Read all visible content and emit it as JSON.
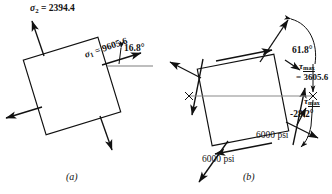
{
  "figure": {
    "units": "psi",
    "ink_color": "#111111",
    "axis_color": "#8a8a8a",
    "background": "#ffffff"
  },
  "panels": [
    {
      "id": "a",
      "caption": "(a)",
      "description": "principal-stress element",
      "element_rotation_deg": -17,
      "labels": {
        "sigma2_symbol": "σ",
        "sigma2_sub": "2",
        "sigma2_text": "= 2394.4",
        "sigma1_symbol": "σ",
        "sigma1_sub": "1",
        "sigma1_text": "= 9605.6",
        "angle": "16.8°"
      },
      "values": {
        "sigma_1": 9605.6,
        "sigma_2": 2394.4,
        "theta_p": 16.8
      }
    },
    {
      "id": "b",
      "caption": "(b)",
      "description": "maximum-shear-stress element",
      "element_rotation_deg": -11,
      "labels": {
        "tau_symbol": "τ",
        "tau_sub": "max",
        "tau_value": "= 3605.6",
        "tau_symbol_2": "τ",
        "tau_sub_2": "max",
        "angle_upper": "61.8°",
        "angle_lower": "-28.2°",
        "normal_stress_right": "6000 psi",
        "normal_stress_left": "6000 psi"
      },
      "values": {
        "tau_max": 3605.6,
        "sigma_avg": 6000,
        "theta_s_upper": 61.8,
        "theta_s_lower": -28.2
      }
    }
  ]
}
